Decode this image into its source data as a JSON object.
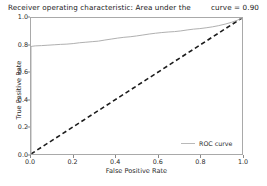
{
  "chart_data": {
    "type": "line",
    "title": "Receiver operating characteristic: Area under the",
    "title_auc": "curve = 0.90",
    "auc_value": 0.9,
    "xlabel": "False Positive Rate",
    "ylabel": "True Positive Rate",
    "xlim": [
      0.0,
      1.0
    ],
    "ylim": [
      0.0,
      1.0
    ],
    "grid": false,
    "legend_position": "lower right",
    "xticks": [
      "0.0",
      "0.2",
      "0.4",
      "0.6",
      "0.8",
      "1.0"
    ],
    "xtick_values": [
      0.0,
      0.2,
      0.4,
      0.6,
      0.8,
      1.0
    ],
    "yticks": [
      "0.0",
      "0.2",
      "0.4",
      "0.6",
      "0.8",
      "1.0"
    ],
    "ytick_values": [
      0.0,
      0.2,
      0.4,
      0.6,
      0.8,
      1.0
    ],
    "series": [
      {
        "name": "ROC curve",
        "style": "solid",
        "color": "#b0b0b0",
        "x": [
          0.0,
          0.0,
          0.005,
          0.02,
          0.05,
          0.08,
          0.11,
          0.14,
          0.17,
          0.2,
          0.23,
          0.26,
          0.29,
          0.32,
          0.35,
          0.38,
          0.41,
          0.44,
          0.47,
          0.5,
          0.53,
          0.56,
          0.59,
          0.62,
          0.65,
          0.68,
          0.71,
          0.74,
          0.77,
          0.8,
          0.83,
          0.86,
          0.89,
          0.92,
          0.95,
          0.98,
          1.0
        ],
        "y": [
          0.0,
          0.79,
          0.792,
          0.795,
          0.797,
          0.8,
          0.803,
          0.806,
          0.808,
          0.812,
          0.818,
          0.822,
          0.826,
          0.83,
          0.838,
          0.845,
          0.852,
          0.858,
          0.862,
          0.868,
          0.875,
          0.882,
          0.888,
          0.893,
          0.897,
          0.9,
          0.905,
          0.912,
          0.918,
          0.922,
          0.928,
          0.935,
          0.944,
          0.955,
          0.968,
          0.985,
          1.0
        ]
      },
      {
        "name": "chance",
        "style": "dashed",
        "color": "#1c1c1c",
        "x": [
          0.0,
          1.0
        ],
        "y": [
          0.0,
          1.0
        ]
      }
    ],
    "legend": [
      {
        "label": "ROC curve",
        "color": "#b9b9b9",
        "style": "solid"
      }
    ]
  }
}
